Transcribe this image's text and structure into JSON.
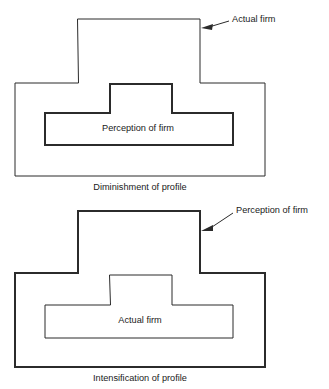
{
  "figures": [
    {
      "id": "diminishment",
      "caption": "Diminishment of profile",
      "caption_x": 140,
      "caption_y": 190,
      "outer": {
        "label": "Actual firm",
        "name": "actual-firm-shape",
        "weight": "thin",
        "path": "M 78 19 L 200 19 L 200 83 L 265 83 L 265 176 L 15 176 L 15 83 L 78 83 Z"
      },
      "inner": {
        "label": "Perception of firm",
        "name": "perception-of-firm-shape",
        "weight": "thick",
        "path": "M 110 84 L 172 84 L 172 113 L 233 113 L 233 145 L 45 145 L 45 113 L 110 113 Z",
        "label_x": 138,
        "label_y": 131
      },
      "callout": {
        "text": "Actual firm",
        "text_x": 232,
        "text_y": 22,
        "leader": "M 229 21 L 209 27",
        "arrow": "M 201 28 L 213 24 L 212 30 Z",
        "target_name": "actual-firm-callout"
      }
    },
    {
      "id": "intensification",
      "caption": "Intensification of profile",
      "caption_x": 140,
      "caption_y": 381,
      "outer": {
        "label": "Perception of firm",
        "name": "perception-of-firm-shape",
        "weight": "thick",
        "path": "M 78 211 L 200 211 L 200 273 L 265 273 L 265 367 L 15 367 L 15 273 L 78 273 Z"
      },
      "inner": {
        "label": "Actual firm",
        "name": "actual-firm-shape",
        "weight": "thin",
        "path": "M 110 275 L 172 275 L 172 305 L 233 305 L 233 338 L 45 338 L 45 305 L 110 305 Z",
        "label_x": 140,
        "label_y": 323
      },
      "callout": {
        "text": "Perception of firm",
        "text_x": 236,
        "text_y": 213,
        "leader": "M 233 213 L 209 229",
        "arrow": "M 201 231 L 213 225 L 213 231 Z",
        "target_name": "perception-of-firm-callout"
      }
    }
  ]
}
